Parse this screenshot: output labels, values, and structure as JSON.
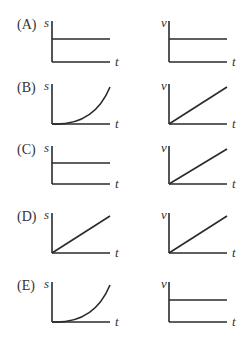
{
  "options": [
    {
      "label": "(A)",
      "s_graph": "constant",
      "v_graph": "constant"
    },
    {
      "label": "(B)",
      "s_graph": "parabola",
      "v_graph": "linear"
    },
    {
      "label": "(C)",
      "s_graph": "constant",
      "v_graph": "linear"
    },
    {
      "label": "(D)",
      "s_graph": "linear",
      "v_graph": "linear"
    },
    {
      "label": "(E)",
      "s_graph": "parabola",
      "v_graph": "constant"
    }
  ],
  "axes": {
    "s_label": "s",
    "v_label": "v",
    "t_label": "t"
  }
}
